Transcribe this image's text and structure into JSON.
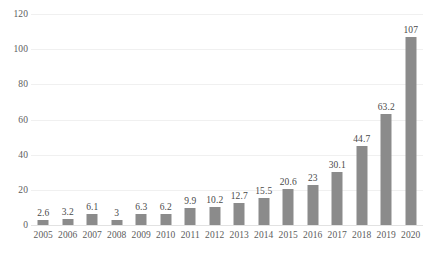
{
  "chart_data": {
    "type": "bar",
    "title": "",
    "subtitle": "",
    "xlabel": "",
    "ylabel": "",
    "categories": [
      "2005",
      "2006",
      "2007",
      "2008",
      "2009",
      "2010",
      "2011",
      "2012",
      "2013",
      "2014",
      "2015",
      "2016",
      "2017",
      "2018",
      "2019",
      "2020"
    ],
    "values": [
      2.6,
      3.2,
      6.1,
      3,
      6.3,
      6.2,
      9.9,
      10.2,
      12.7,
      15.5,
      20.6,
      23,
      30.1,
      44.7,
      63.2,
      107
    ],
    "value_labels": [
      "2.6",
      "3.2",
      "6.1",
      "3",
      "6.3",
      "6.2",
      "9.9",
      "10.2",
      "12.7",
      "15.5",
      "20.6",
      "23",
      "30.1",
      "44.7",
      "63.2",
      "107"
    ],
    "ylim": [
      0,
      120
    ],
    "ytick_values": [
      0,
      20,
      40,
      60,
      80,
      100,
      120
    ],
    "ytick_labels": [
      "0",
      "20",
      "40",
      "60",
      "80",
      "100",
      "120"
    ],
    "grid": true,
    "legend": false,
    "legend_position": "none",
    "annotations": [],
    "series": [
      {
        "name": "",
        "values": [
          2.6,
          3.2,
          6.1,
          3,
          6.3,
          6.2,
          9.9,
          10.2,
          12.7,
          15.5,
          20.6,
          23,
          30.1,
          44.7,
          63.2,
          107
        ]
      }
    ],
    "colors": {
      "bar": "#8b8b8b",
      "gridline": "#f0f0f0",
      "axis_text": "#5c5c5c",
      "label_text": "#4a4a4a",
      "background": "#ffffff"
    }
  }
}
